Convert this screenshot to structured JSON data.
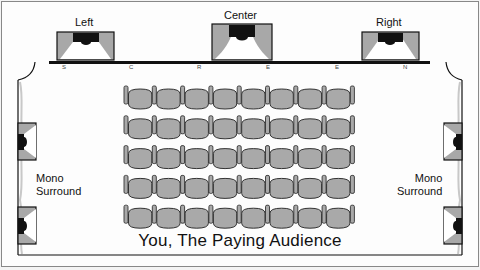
{
  "diagram": {
    "speakers_front": [
      {
        "label": "Left"
      },
      {
        "label": "Center"
      },
      {
        "label": "Right"
      }
    ],
    "screen_letters": [
      "S",
      "C",
      "R",
      "E",
      "E",
      "N"
    ],
    "surround_left": {
      "line1": "Mono",
      "line2": "Surround"
    },
    "surround_right": {
      "line1": "Mono",
      "line2": "Surround"
    },
    "seating": {
      "rows": 5,
      "seats_per_row": 8
    },
    "audience_label": "You, The Paying Audience",
    "colors": {
      "speaker_gray": "#a8a8a8",
      "driver_black": "#111111",
      "seat_gray": "#a9a9a9",
      "outline": "#222222",
      "wall_gray": "#c8c8c8"
    }
  }
}
